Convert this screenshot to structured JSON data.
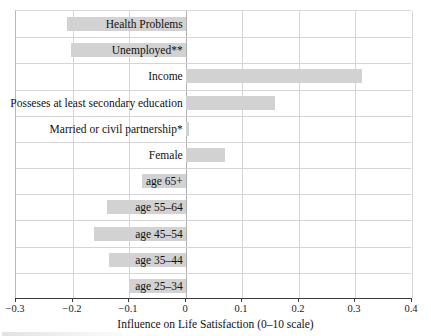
{
  "chart_data": {
    "type": "bar",
    "orientation": "horizontal",
    "title": "",
    "xlabel": "Influence on Life Satisfaction (0–10 scale)",
    "ylabel": "",
    "xlim": [
      -0.3,
      0.4
    ],
    "xticks": [
      -0.3,
      -0.2,
      -0.1,
      0,
      0.1,
      0.2,
      0.3,
      0.4
    ],
    "xticklabels": [
      "−0.3",
      "−0.2",
      "−0.1",
      "0",
      "0.1",
      "0.2",
      "0.3",
      "0.4"
    ],
    "grid": true,
    "grid_axis": "both",
    "legend": "none",
    "bar_color": "#d2d2d2",
    "categories": [
      "Health Problems",
      "Unemployed**",
      "Income",
      "Posseses at least secondary education",
      "Married or civil partnership*",
      "Female",
      "age 65+",
      "age 55–64",
      "age 45–54",
      "age 35–44",
      "age 25–34"
    ],
    "values": [
      -0.21,
      -0.202,
      0.312,
      0.157,
      0.005,
      0.069,
      -0.078,
      -0.14,
      -0.163,
      -0.136,
      -0.1
    ],
    "notes": [
      "* Married or civil partnership",
      "** Unemployed"
    ]
  }
}
